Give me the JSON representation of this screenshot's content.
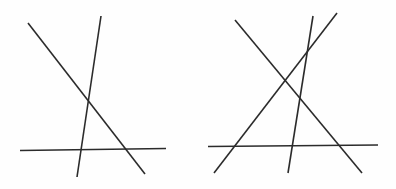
{
  "figure": {
    "canvas": {
      "width": 396,
      "height": 189,
      "background_color": "#fefefe"
    },
    "style": {
      "stroke_color": "#2b2b2b",
      "stroke_width": 1.6
    },
    "panels": [
      {
        "id": "left-panel",
        "name": "left-figure",
        "label": "Left figure: three intersecting segments",
        "segment_count": 3,
        "segments": [
          {
            "id": "left-descending-diagonal",
            "name": "descending-diagonal",
            "x1": 28,
            "y1": 23,
            "x2": 145,
            "y2": 174
          },
          {
            "id": "left-steep-line",
            "name": "steep-ascending-line",
            "x1": 101,
            "y1": 16,
            "x2": 77,
            "y2": 177
          },
          {
            "id": "left-horizontal-line",
            "name": "horizontal-baseline",
            "x1": 20,
            "y1": 150.5,
            "x2": 166,
            "y2": 148.5
          }
        ]
      },
      {
        "id": "right-panel",
        "name": "right-figure",
        "label": "Right figure: four intersecting segments",
        "segment_count": 4,
        "segments": [
          {
            "id": "right-descending-diagonal",
            "name": "descending-diagonal",
            "x1": 235,
            "y1": 20,
            "x2": 362,
            "y2": 173
          },
          {
            "id": "right-ascending-diagonal",
            "name": "ascending-diagonal",
            "x1": 337,
            "y1": 13,
            "x2": 214,
            "y2": 173
          },
          {
            "id": "right-steep-line",
            "name": "steep-near-vertical-line",
            "x1": 313,
            "y1": 16,
            "x2": 288,
            "y2": 173
          },
          {
            "id": "right-horizontal-line",
            "name": "horizontal-baseline",
            "x1": 208,
            "y1": 146.5,
            "x2": 378,
            "y2": 145
          }
        ]
      }
    ]
  }
}
